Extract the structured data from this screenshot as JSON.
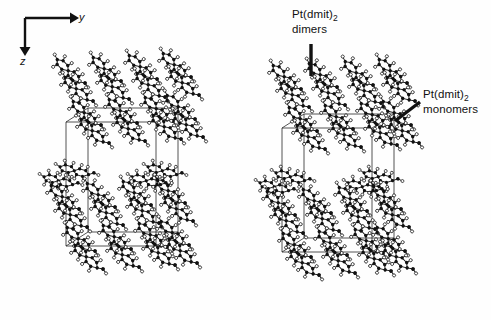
{
  "figure": {
    "background_color": "#fefefe",
    "ink_color": "#111111",
    "width": 491,
    "height": 320
  },
  "axes": {
    "name": "axis-indicator",
    "origin": {
      "x": 25,
      "y": 18
    },
    "horizontal": {
      "label": "y",
      "direction": "right",
      "length": 50
    },
    "vertical": {
      "label": "z",
      "direction": "down",
      "length": 37
    }
  },
  "annotations": [
    {
      "id": "dimers",
      "species": "Pt(dmit)",
      "subscript": "2",
      "second_line": "dimers",
      "leader": {
        "type": "vertical-bar",
        "x": 311,
        "y_start": 44,
        "y_end": 76
      }
    },
    {
      "id": "monomers",
      "species": "Pt(dmit)",
      "subscript": "2",
      "second_line": "monomers",
      "leader": {
        "type": "diagonal-bar",
        "x_start": 395,
        "y_start": 121,
        "x_end": 420,
        "y_end": 102
      }
    }
  ],
  "structures": [
    {
      "id": "left-panel",
      "name": "crystal-structure-left",
      "bounds": {
        "x": 38,
        "y": 44,
        "width": 152,
        "height": 258
      },
      "unit_cell": {
        "front_left_x": 66,
        "front_right_x": 156,
        "top_y": 122,
        "bottom_y": 246,
        "depth_dx": 22,
        "depth_dy": -14
      },
      "layers": [
        {
          "type": "dimer-stack",
          "tier": "upper",
          "rows": 2,
          "columns": 4
        },
        {
          "type": "monomer-band",
          "tier": "middle",
          "columns": 4
        },
        {
          "type": "dimer-stack",
          "tier": "lower",
          "rows": 2,
          "columns": 4
        }
      ]
    },
    {
      "id": "right-panel",
      "name": "crystal-structure-right",
      "bounds": {
        "x": 254,
        "y": 50,
        "width": 152,
        "height": 252
      },
      "unit_cell": {
        "front_left_x": 282,
        "front_right_x": 372,
        "top_y": 128,
        "bottom_y": 252,
        "depth_dx": 22,
        "depth_dy": -14
      },
      "layers": [
        {
          "type": "dimer-stack",
          "tier": "upper",
          "rows": 2,
          "columns": 4
        },
        {
          "type": "monomer-band",
          "tier": "middle",
          "columns": 4
        },
        {
          "type": "dimer-stack",
          "tier": "lower",
          "rows": 2,
          "columns": 4
        }
      ]
    }
  ]
}
